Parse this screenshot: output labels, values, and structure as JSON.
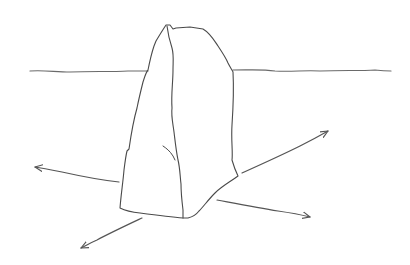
{
  "image": {
    "subject": "pencil sketch of a standing stone (menhir) with horizon line and four directional arrows",
    "colors": {
      "background": "#ffffff",
      "stroke": "#4a4a4a",
      "horizon": "#6a6a6a",
      "arrow": "#555555"
    },
    "elements": [
      {
        "name": "horizon-line",
        "description": "wavy horizon line behind the stone"
      },
      {
        "name": "standing-stone",
        "description": "tall irregular stone with a vertical ridge/crack"
      },
      {
        "name": "arrow-left",
        "description": "arrow pointing left from the stone"
      },
      {
        "name": "arrow-down-left",
        "description": "arrow pointing down-left from the stone base"
      },
      {
        "name": "arrow-up-right",
        "description": "arrow pointing up-right from the stone"
      },
      {
        "name": "arrow-down-right",
        "description": "arrow pointing right/slightly down from the stone base"
      }
    ]
  }
}
